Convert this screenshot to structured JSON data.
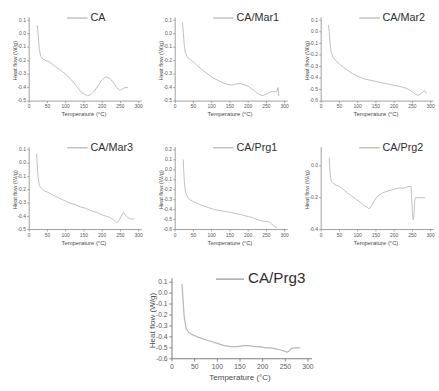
{
  "figure": {
    "panel_count": 7,
    "layout": "3-3-1 grid",
    "curve_color": "#b9b9b9",
    "axis_color": "#6f6f6f",
    "text_color": "#4a4a4a"
  },
  "axis_titles": {
    "x": "Temperature (°C)",
    "y": "Heat flow (W/g)"
  },
  "chart_data": [
    {
      "type": "line",
      "title": "CA",
      "legend": [
        "CA"
      ],
      "xlabel": "Temperature (°C)",
      "ylabel": "Heat flow (W/g)",
      "xlim": [
        0,
        300
      ],
      "ylim": [
        -0.5,
        0.1
      ],
      "xticks": [
        0,
        50,
        100,
        150,
        200,
        250,
        300
      ],
      "yticks": [
        0.1,
        0.0,
        -0.1,
        -0.2,
        -0.3,
        -0.4,
        -0.5
      ],
      "grid": false,
      "legend_position": "top-right",
      "x": [
        22,
        24,
        26,
        28,
        32,
        38,
        46,
        56,
        70,
        85,
        100,
        115,
        130,
        145,
        160,
        170,
        180,
        190,
        200,
        210,
        220,
        230,
        240,
        248,
        255,
        262,
        270
      ],
      "y": [
        0.06,
        0.01,
        -0.06,
        -0.12,
        -0.17,
        -0.19,
        -0.2,
        -0.21,
        -0.24,
        -0.27,
        -0.3,
        -0.34,
        -0.39,
        -0.44,
        -0.46,
        -0.45,
        -0.42,
        -0.38,
        -0.34,
        -0.32,
        -0.33,
        -0.36,
        -0.4,
        -0.42,
        -0.41,
        -0.4,
        -0.4
      ]
    },
    {
      "type": "line",
      "title": "CA/Mar1",
      "legend": [
        "CA/Mar1"
      ],
      "xlabel": "Temperature (°C)",
      "ylabel": "Heat flow (W/g)",
      "xlim": [
        0,
        300
      ],
      "ylim": [
        -0.5,
        0.1
      ],
      "xticks": [
        0,
        50,
        100,
        150,
        200,
        250,
        300
      ],
      "yticks": [
        0.1,
        0.0,
        -0.1,
        -0.2,
        -0.3,
        -0.4,
        -0.5
      ],
      "grid": false,
      "legend_position": "top-right",
      "x": [
        20,
        22,
        24,
        27,
        32,
        40,
        50,
        62,
        75,
        90,
        105,
        120,
        135,
        150,
        160,
        170,
        180,
        190,
        200,
        210,
        220,
        230,
        240,
        248,
        255,
        262,
        270,
        278,
        282,
        284
      ],
      "y": [
        0.08,
        0.02,
        -0.06,
        -0.13,
        -0.17,
        -0.19,
        -0.21,
        -0.24,
        -0.27,
        -0.3,
        -0.33,
        -0.35,
        -0.37,
        -0.38,
        -0.38,
        -0.37,
        -0.37,
        -0.38,
        -0.39,
        -0.41,
        -0.43,
        -0.45,
        -0.46,
        -0.45,
        -0.44,
        -0.43,
        -0.43,
        -0.43,
        -0.4,
        -0.46
      ]
    },
    {
      "type": "line",
      "title": "CA/Mar2",
      "legend": [
        "CA/Mar2"
      ],
      "xlabel": "Temperature (°C)",
      "ylabel": "Heat flow (W/g)",
      "xlim": [
        0,
        300
      ],
      "ylim": [
        -0.6,
        0.1
      ],
      "xticks": [
        0,
        50,
        100,
        150,
        200,
        250,
        300
      ],
      "yticks": [
        0.1,
        0.0,
        -0.1,
        -0.2,
        -0.3,
        -0.4,
        -0.5,
        -0.6
      ],
      "grid": false,
      "legend_position": "top-right",
      "x": [
        20,
        22,
        24,
        27,
        32,
        40,
        50,
        62,
        75,
        90,
        105,
        120,
        135,
        150,
        165,
        180,
        195,
        210,
        225,
        240,
        250,
        258,
        265,
        272,
        278,
        284,
        288
      ],
      "y": [
        0.055,
        0.0,
        -0.09,
        -0.17,
        -0.22,
        -0.25,
        -0.28,
        -0.31,
        -0.34,
        -0.37,
        -0.39,
        -0.41,
        -0.42,
        -0.43,
        -0.44,
        -0.45,
        -0.46,
        -0.47,
        -0.48,
        -0.5,
        -0.52,
        -0.54,
        -0.55,
        -0.54,
        -0.52,
        -0.51,
        -0.53
      ]
    },
    {
      "type": "line",
      "title": "CA/Mar3",
      "legend": [
        "CA/Mar3"
      ],
      "xlabel": "Temperature (°C)",
      "ylabel": "Heat flow (W/g)",
      "xlim": [
        0,
        300
      ],
      "ylim": [
        -0.5,
        0.1
      ],
      "xticks": [
        0,
        50,
        100,
        150,
        200,
        250,
        300
      ],
      "yticks": [
        0.1,
        0.0,
        -0.1,
        -0.2,
        -0.3,
        -0.4,
        -0.5
      ],
      "grid": false,
      "legend_position": "top-right",
      "x": [
        20,
        22,
        24,
        28,
        34,
        42,
        52,
        65,
        80,
        95,
        110,
        125,
        140,
        155,
        170,
        185,
        200,
        212,
        222,
        232,
        240,
        246,
        252,
        258,
        264,
        270,
        278,
        286
      ],
      "y": [
        0.07,
        0.0,
        -0.1,
        -0.17,
        -0.19,
        -0.21,
        -0.22,
        -0.24,
        -0.26,
        -0.28,
        -0.3,
        -0.31,
        -0.33,
        -0.34,
        -0.36,
        -0.37,
        -0.39,
        -0.4,
        -0.41,
        -0.43,
        -0.45,
        -0.43,
        -0.4,
        -0.37,
        -0.39,
        -0.41,
        -0.42,
        -0.42
      ]
    },
    {
      "type": "line",
      "title": "CA/Prg1",
      "legend": [
        "CA/Prg1"
      ],
      "xlabel": "Temperature (°C)",
      "ylabel": "Heat flow (W/g)",
      "xlim": [
        0,
        300
      ],
      "ylim": [
        -0.6,
        0.2
      ],
      "xticks": [
        0,
        50,
        100,
        150,
        200,
        250,
        300
      ],
      "yticks": [
        0.2,
        0.1,
        0.0,
        -0.1,
        -0.2,
        -0.3,
        -0.4,
        -0.5,
        -0.6
      ],
      "grid": false,
      "legend_position": "top-right",
      "x": [
        22,
        23,
        25,
        28,
        33,
        40,
        50,
        62,
        76,
        92,
        108,
        124,
        140,
        155,
        168,
        180,
        190,
        200,
        212,
        224,
        236,
        246,
        254,
        260,
        266,
        272,
        278
      ],
      "y": [
        0.1,
        0.02,
        -0.12,
        -0.22,
        -0.27,
        -0.3,
        -0.32,
        -0.34,
        -0.36,
        -0.38,
        -0.4,
        -0.41,
        -0.42,
        -0.43,
        -0.44,
        -0.45,
        -0.46,
        -0.47,
        -0.48,
        -0.5,
        -0.51,
        -0.52,
        -0.52,
        -0.53,
        -0.55,
        -0.57,
        -0.58
      ]
    },
    {
      "type": "line",
      "title": "CA/Prg2",
      "legend": [
        "CA/Prg2"
      ],
      "xlabel": "Temperature (°C)",
      "ylabel": "Heat flow (W/g)",
      "xlim": [
        0,
        300
      ],
      "ylim": [
        -0.4,
        0.1
      ],
      "xticks": [
        0,
        50,
        100,
        150,
        200,
        250,
        300
      ],
      "yticks": [
        0.0,
        -0.2,
        -0.4
      ],
      "grid": false,
      "legend_position": "top-right",
      "x": [
        22,
        23,
        25,
        28,
        33,
        40,
        50,
        62,
        72,
        84,
        96,
        108,
        118,
        126,
        132,
        138,
        145,
        155,
        168,
        180,
        195,
        210,
        225,
        238,
        246,
        250,
        252,
        254,
        256,
        258,
        262,
        268,
        276,
        284
      ],
      "y": [
        0.05,
        0.0,
        -0.06,
        -0.1,
        -0.11,
        -0.12,
        -0.13,
        -0.15,
        -0.17,
        -0.19,
        -0.21,
        -0.23,
        -0.25,
        -0.26,
        -0.27,
        -0.25,
        -0.22,
        -0.19,
        -0.17,
        -0.16,
        -0.15,
        -0.14,
        -0.14,
        -0.13,
        -0.13,
        -0.3,
        -0.34,
        -0.32,
        -0.22,
        -0.2,
        -0.2,
        -0.2,
        -0.2,
        -0.2
      ]
    },
    {
      "type": "line",
      "title": "CA/Prg3",
      "legend": [
        "CA/Prg3"
      ],
      "xlabel": "Temperature (°C)",
      "ylabel": "Heat flow (W/g)",
      "xlim": [
        0,
        300
      ],
      "ylim": [
        -0.6,
        0.1
      ],
      "xticks": [
        0,
        50,
        100,
        150,
        200,
        250,
        300
      ],
      "yticks": [
        0.1,
        0.0,
        -0.1,
        -0.2,
        -0.3,
        -0.4,
        -0.5,
        -0.6
      ],
      "grid": false,
      "legend_position": "top-right",
      "x": [
        22,
        23,
        25,
        27,
        31,
        37,
        45,
        56,
        70,
        85,
        100,
        115,
        130,
        145,
        158,
        170,
        182,
        194,
        206,
        218,
        230,
        240,
        248,
        254,
        258,
        262,
        268,
        274,
        282
      ],
      "y": [
        0.08,
        0.03,
        -0.1,
        -0.22,
        -0.32,
        -0.36,
        -0.38,
        -0.4,
        -0.42,
        -0.44,
        -0.46,
        -0.48,
        -0.49,
        -0.49,
        -0.48,
        -0.48,
        -0.49,
        -0.49,
        -0.5,
        -0.5,
        -0.51,
        -0.52,
        -0.53,
        -0.54,
        -0.53,
        -0.51,
        -0.5,
        -0.5,
        -0.5
      ]
    }
  ]
}
